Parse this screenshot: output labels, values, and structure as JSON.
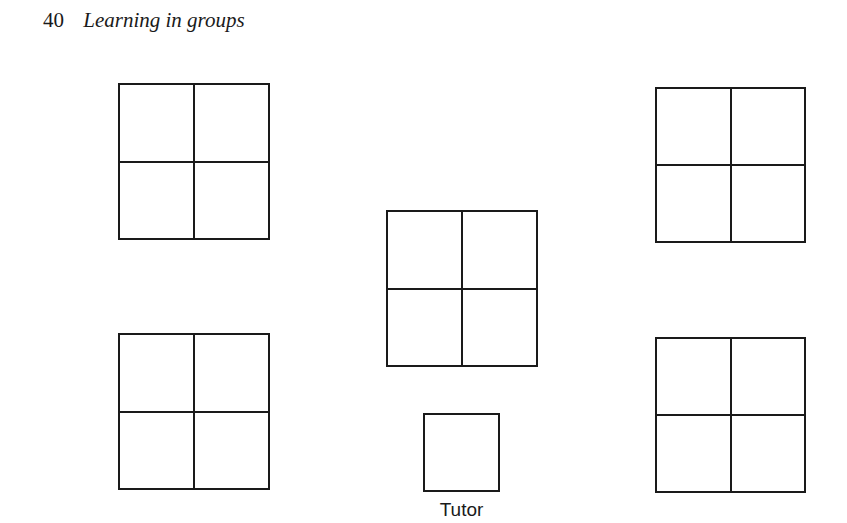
{
  "header": {
    "page_number": "40",
    "running_title": "Learning in groups"
  },
  "diagram": {
    "groups": [
      {
        "id": "top-left",
        "x": 118,
        "y": 83,
        "w": 152,
        "h": 157,
        "seats": 4
      },
      {
        "id": "top-right",
        "x": 655,
        "y": 87,
        "w": 151,
        "h": 156,
        "seats": 4
      },
      {
        "id": "center",
        "x": 386,
        "y": 210,
        "w": 152,
        "h": 157,
        "seats": 4
      },
      {
        "id": "bottom-left",
        "x": 118,
        "y": 333,
        "w": 152,
        "h": 157,
        "seats": 4
      },
      {
        "id": "bottom-right",
        "x": 655,
        "y": 337,
        "w": 151,
        "h": 156,
        "seats": 4
      }
    ],
    "tutor": {
      "x": 423,
      "y": 413,
      "w": 77,
      "h": 79,
      "label": "Tutor"
    }
  }
}
